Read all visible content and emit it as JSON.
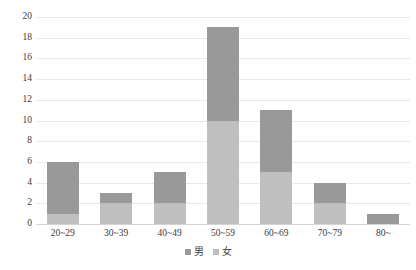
{
  "chart_data": {
    "type": "bar",
    "subtype": "stacked-bar",
    "title": "",
    "xlabel": "",
    "ylabel": "",
    "ylim": [
      0,
      20
    ],
    "ytick_step": 2,
    "yticks": [
      "0",
      "2",
      "4",
      "6",
      "8",
      "10",
      "12",
      "14",
      "16",
      "18",
      "20"
    ],
    "grid": true,
    "legend_position": "bottom",
    "categories": [
      "20~29",
      "30~39",
      "40~49",
      "50~59",
      "60~69",
      "70~79",
      "80~"
    ],
    "series": [
      {
        "name": "女",
        "color": "#bfbfbf",
        "stack_order": "bottom",
        "values": [
          1,
          2,
          2,
          10,
          5,
          2,
          0
        ]
      },
      {
        "name": "男",
        "color": "#999999",
        "stack_order": "top",
        "values": [
          5,
          1,
          3,
          9,
          6,
          2,
          1
        ]
      }
    ],
    "totals": [
      6,
      3,
      5,
      19,
      11,
      4,
      1
    ]
  },
  "legend": {
    "items": [
      {
        "label": "男",
        "color": "#999999",
        "marker": "square-swatch"
      },
      {
        "label": "女",
        "color": "#bfbfbf",
        "marker": "square-swatch"
      }
    ]
  },
  "colors": {
    "male": "#999999",
    "female": "#bfbfbf",
    "gridline": "#e8e8e8",
    "axis": "#d4d4d4",
    "text": "#3a3a3a",
    "background": "#ffffff"
  }
}
